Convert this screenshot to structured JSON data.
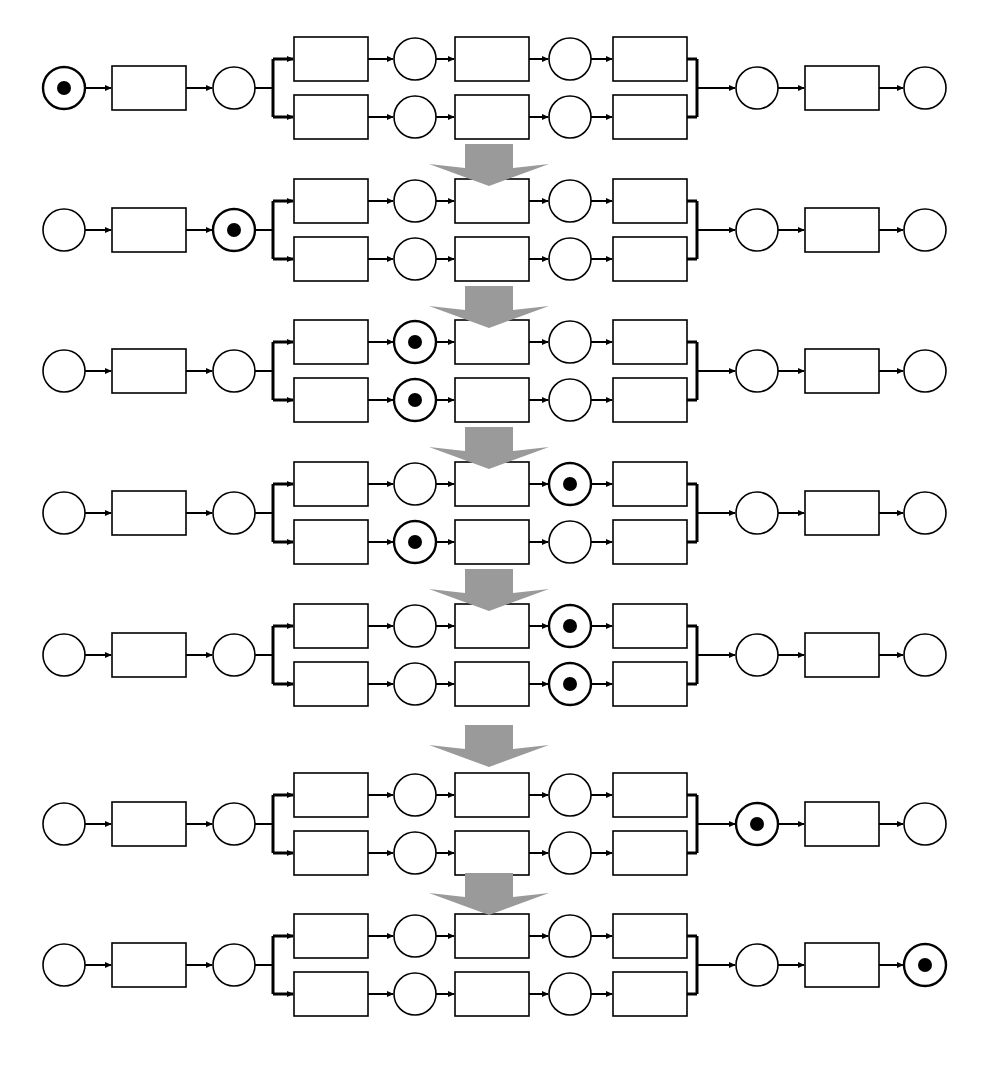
{
  "figure": {
    "type": "petri-net-firing-sequence",
    "title": "",
    "width": 981,
    "height": 1065,
    "background_color": "#ffffff",
    "stroke_color": "#000000",
    "token_color": "#000000",
    "separator_arrow_color": "#9a9a9a",
    "place_shape": "circle",
    "transition_shape": "rectangle",
    "place_radius": 21,
    "token_radius": 7,
    "transition_width": 74,
    "transition_height": 44,
    "branch_offset": 29
  },
  "geometry": {
    "row_centers": [
      88,
      230,
      371,
      513,
      655,
      824,
      965
    ],
    "separator_centers_y": [
      165,
      307,
      448,
      590,
      746,
      894
    ],
    "separator_center_x": 489,
    "nodes_x": {
      "p_start": 64,
      "t_start": 149,
      "p_fork": 234,
      "fork_bar": 273,
      "t_a1": 331,
      "p_a2": 415,
      "t_a3": 492,
      "p_a4": 570,
      "t_a5": 650,
      "join_bar": 697,
      "p_join": 757,
      "t_end": 842,
      "p_end": 925
    }
  },
  "net_structure": {
    "places": [
      {
        "id": "p1",
        "name": "start-place",
        "branch": "main",
        "column": "p_start"
      },
      {
        "id": "p2",
        "name": "pre-fork-place",
        "branch": "main",
        "column": "p_fork"
      },
      {
        "id": "p3t",
        "name": "top-branch-place-1",
        "branch": "top",
        "column": "p_a2"
      },
      {
        "id": "p4t",
        "name": "top-branch-place-2",
        "branch": "top",
        "column": "p_a4"
      },
      {
        "id": "p3b",
        "name": "bottom-branch-place-1",
        "branch": "bottom",
        "column": "p_a2"
      },
      {
        "id": "p4b",
        "name": "bottom-branch-place-2",
        "branch": "bottom",
        "column": "p_a4"
      },
      {
        "id": "p5",
        "name": "post-join-place",
        "branch": "main",
        "column": "p_join"
      },
      {
        "id": "p6",
        "name": "end-place",
        "branch": "main",
        "column": "p_end"
      }
    ],
    "transitions": [
      {
        "id": "t1",
        "name": "start-transition",
        "branch": "main",
        "column": "t_start"
      },
      {
        "id": "t2t",
        "name": "top-branch-transition-1",
        "branch": "top",
        "column": "t_a1"
      },
      {
        "id": "t3t",
        "name": "top-branch-transition-2",
        "branch": "top",
        "column": "t_a3"
      },
      {
        "id": "t4t",
        "name": "top-branch-transition-3",
        "branch": "top",
        "column": "t_a5"
      },
      {
        "id": "t2b",
        "name": "bottom-branch-transition-1",
        "branch": "bottom",
        "column": "t_a1"
      },
      {
        "id": "t3b",
        "name": "bottom-branch-transition-2",
        "branch": "bottom",
        "column": "t_a3"
      },
      {
        "id": "t4b",
        "name": "bottom-branch-transition-3",
        "branch": "bottom",
        "column": "t_a5"
      },
      {
        "id": "t5",
        "name": "end-transition",
        "branch": "main",
        "column": "t_end"
      }
    ]
  },
  "rows": [
    {
      "index": 1,
      "label": "marking-1",
      "marked_places": [
        "p1"
      ],
      "description": "Token in start place"
    },
    {
      "index": 2,
      "label": "marking-2",
      "marked_places": [
        "p2"
      ],
      "description": "Token in pre-fork place"
    },
    {
      "index": 3,
      "label": "marking-3",
      "marked_places": [
        "p3t",
        "p3b"
      ],
      "description": "Tokens in both branch place 1"
    },
    {
      "index": 4,
      "label": "marking-4",
      "marked_places": [
        "p4t",
        "p3b"
      ],
      "description": "Token advanced on top branch only"
    },
    {
      "index": 5,
      "label": "marking-5",
      "marked_places": [
        "p4t",
        "p4b"
      ],
      "description": "Tokens in both branch place 2"
    },
    {
      "index": 6,
      "label": "marking-6",
      "marked_places": [
        "p5"
      ],
      "description": "Token in post-join place"
    },
    {
      "index": 7,
      "label": "marking-7",
      "marked_places": [
        "p6"
      ],
      "description": "Token in end place"
    }
  ],
  "separators": [
    {
      "index": 1,
      "name": "step-arrow-1"
    },
    {
      "index": 2,
      "name": "step-arrow-2"
    },
    {
      "index": 3,
      "name": "step-arrow-3"
    },
    {
      "index": 4,
      "name": "step-arrow-4"
    },
    {
      "index": 5,
      "name": "step-arrow-5"
    },
    {
      "index": 6,
      "name": "step-arrow-6"
    }
  ]
}
